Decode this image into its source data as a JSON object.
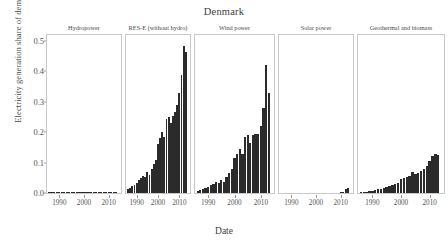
{
  "chart_data": {
    "type": "bar",
    "title": "Denmark",
    "xlabel": "Date",
    "ylabel": "Electricity generation share of demand",
    "ylim": [
      0.0,
      0.52
    ],
    "yticks": [
      0.0,
      0.1,
      0.2,
      0.3,
      0.4,
      0.5
    ],
    "ytick_labels": [
      "0.0",
      "0.1",
      "0.2",
      "0.3",
      "0.4",
      "0.5"
    ],
    "xlim": [
      1985,
      2015
    ],
    "xticks": [
      1990,
      2000,
      2010
    ],
    "xtick_labels": [
      "1990",
      "2000",
      "2010"
    ],
    "grid": false,
    "legend": "none",
    "bar_color": "#2b2b2b",
    "facet_layout": "1x5",
    "panels": [
      {
        "label": "Hydropower",
        "x": [
          1986,
          1987,
          1988,
          1989,
          1990,
          1991,
          1992,
          1993,
          1994,
          1995,
          1996,
          1997,
          1998,
          1999,
          2000,
          2001,
          2002,
          2003,
          2004,
          2005,
          2006,
          2007,
          2008,
          2009,
          2010,
          2011,
          2012,
          2013
        ],
        "values": [
          0.0005,
          0.0005,
          0.0005,
          0.0005,
          0.0005,
          0.0005,
          0.0006,
          0.0006,
          0.0006,
          0.0006,
          0.0004,
          0.0005,
          0.0006,
          0.0006,
          0.0008,
          0.0008,
          0.0008,
          0.0006,
          0.0007,
          0.0008,
          0.0008,
          0.0008,
          0.0008,
          0.0006,
          0.0006,
          0.0006,
          0.0006,
          0.0006
        ]
      },
      {
        "label": "RES-E (without hydro)",
        "x": [
          1986,
          1987,
          1988,
          1989,
          1990,
          1991,
          1992,
          1993,
          1994,
          1995,
          1996,
          1997,
          1998,
          1999,
          2000,
          2001,
          2002,
          2003,
          2004,
          2005,
          2006,
          2007,
          2008,
          2009,
          2010,
          2011,
          2012,
          2013
        ],
        "values": [
          0.013,
          0.018,
          0.023,
          0.028,
          0.033,
          0.042,
          0.05,
          0.056,
          0.052,
          0.068,
          0.06,
          0.08,
          0.095,
          0.11,
          0.16,
          0.18,
          0.2,
          0.185,
          0.245,
          0.25,
          0.23,
          0.255,
          0.265,
          0.29,
          0.33,
          0.39,
          0.485,
          0.465
        ]
      },
      {
        "label": "Wind power",
        "x": [
          1986,
          1987,
          1988,
          1989,
          1990,
          1991,
          1992,
          1993,
          1994,
          1995,
          1996,
          1997,
          1998,
          1999,
          2000,
          2001,
          2002,
          2003,
          2004,
          2005,
          2006,
          2007,
          2008,
          2009,
          2010,
          2011,
          2012,
          2013
        ],
        "values": [
          0.006,
          0.009,
          0.013,
          0.017,
          0.021,
          0.027,
          0.03,
          0.035,
          0.033,
          0.042,
          0.035,
          0.052,
          0.065,
          0.078,
          0.115,
          0.13,
          0.145,
          0.13,
          0.185,
          0.19,
          0.165,
          0.19,
          0.195,
          0.195,
          0.22,
          0.28,
          0.42,
          0.33
        ]
      },
      {
        "label": "Solar power",
        "x": [
          1986,
          1987,
          1988,
          1989,
          1990,
          1991,
          1992,
          1993,
          1994,
          1995,
          1996,
          1997,
          1998,
          1999,
          2000,
          2001,
          2002,
          2003,
          2004,
          2005,
          2006,
          2007,
          2008,
          2009,
          2010,
          2011,
          2012,
          2013
        ],
        "values": [
          0,
          0,
          0,
          0,
          0,
          0,
          0,
          0,
          0,
          0,
          0,
          0,
          0,
          0,
          0,
          0,
          0,
          0,
          0,
          0,
          0,
          0,
          0,
          0,
          0.0015,
          0.004,
          0.013,
          0.016
        ]
      },
      {
        "label": "Geothermal and biomass",
        "x": [
          1986,
          1987,
          1988,
          1989,
          1990,
          1991,
          1992,
          1993,
          1994,
          1995,
          1996,
          1997,
          1998,
          1999,
          2000,
          2001,
          2002,
          2003,
          2004,
          2005,
          2006,
          2007,
          2008,
          2009,
          2010,
          2011,
          2012,
          2013
        ],
        "values": [
          0.002,
          0.003,
          0.004,
          0.006,
          0.008,
          0.01,
          0.012,
          0.014,
          0.016,
          0.02,
          0.022,
          0.026,
          0.03,
          0.034,
          0.045,
          0.05,
          0.052,
          0.055,
          0.07,
          0.062,
          0.065,
          0.072,
          0.078,
          0.09,
          0.105,
          0.122,
          0.13,
          0.125
        ]
      }
    ]
  }
}
